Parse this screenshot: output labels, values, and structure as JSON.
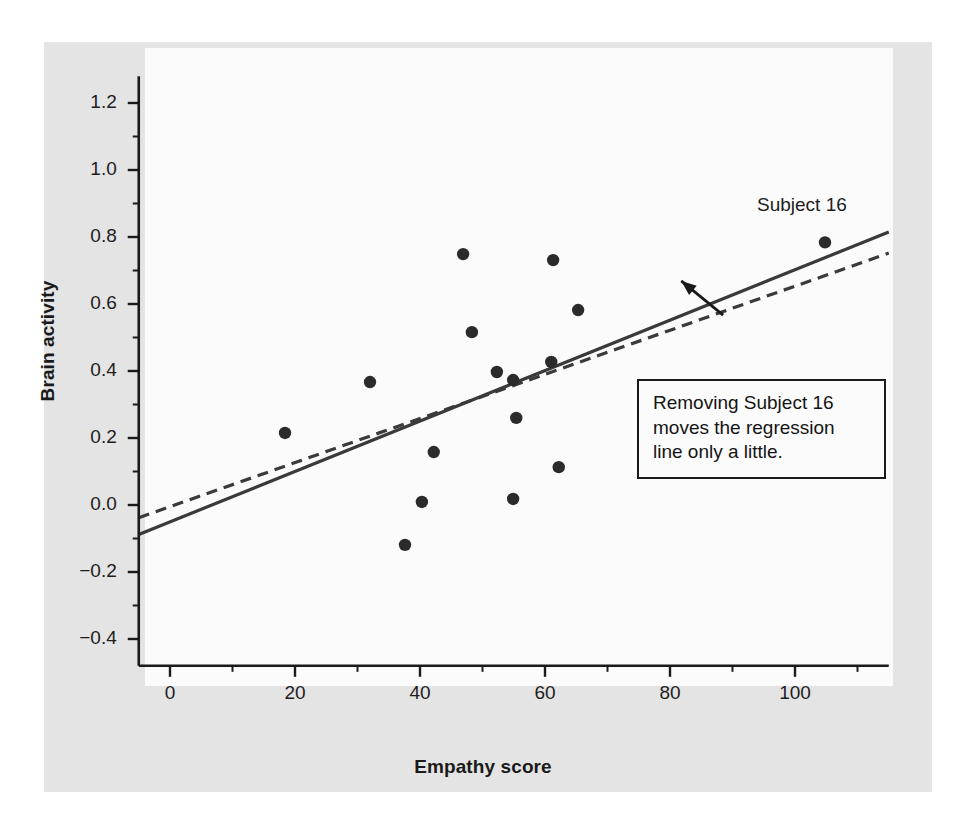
{
  "figure": {
    "background_color": "#e4e4e4",
    "plot_background_color": "#fbfbfb",
    "axis_color": "#1a1a1a",
    "point_color": "#2b2b2b"
  },
  "annotations": {
    "subject_label": "Subject 16",
    "callout_line_1": "Removing Subject 16",
    "callout_line_2": "moves the regression",
    "callout_line_3": "line only a little."
  },
  "chart_data": {
    "type": "scatter",
    "title": "",
    "xlabel": "Empathy score",
    "ylabel": "Brain activity",
    "xlim": [
      -5,
      115
    ],
    "ylim": [
      -0.48,
      1.28
    ],
    "xticks": [
      0,
      20,
      40,
      60,
      80,
      100
    ],
    "xtick_labels": [
      "0",
      "20",
      "40",
      "60",
      "80",
      "100"
    ],
    "yticks": [
      -0.4,
      -0.2,
      0.0,
      0.2,
      0.4,
      0.6,
      0.8,
      1.0,
      1.2
    ],
    "ytick_labels": [
      "-0.4",
      "-0.2",
      "0.0",
      "0.2",
      "0.4",
      "0.6",
      "0.8",
      "1.0",
      "1.2"
    ],
    "x_minor_ticks": [
      10,
      30,
      50,
      70,
      90,
      110
    ],
    "y_minor_ticks": [
      -0.3,
      -0.1,
      0.1,
      0.3,
      0.5,
      0.7,
      0.9,
      1.1
    ],
    "grid": false,
    "legend": false,
    "points": [
      {
        "x": 18.4,
        "y": 0.215
      },
      {
        "x": 32.0,
        "y": 0.367
      },
      {
        "x": 37.6,
        "y": -0.119
      },
      {
        "x": 40.3,
        "y": 0.009
      },
      {
        "x": 42.2,
        "y": 0.158
      },
      {
        "x": 46.9,
        "y": 0.749
      },
      {
        "x": 48.3,
        "y": 0.516
      },
      {
        "x": 52.3,
        "y": 0.397
      },
      {
        "x": 54.9,
        "y": 0.373
      },
      {
        "x": 54.9,
        "y": 0.018
      },
      {
        "x": 55.4,
        "y": 0.26
      },
      {
        "x": 61.0,
        "y": 0.427
      },
      {
        "x": 61.3,
        "y": 0.731
      },
      {
        "x": 62.2,
        "y": 0.113
      },
      {
        "x": 65.3,
        "y": 0.582
      },
      {
        "x": 104.8,
        "y": 0.784,
        "label": "Subject 16"
      }
    ],
    "series": [
      {
        "name": "Regression line (all subjects)",
        "style": "solid",
        "x": [
          -5,
          115
        ],
        "y": [
          -0.088,
          0.815
        ]
      },
      {
        "name": "Regression line (Subject 16 removed)",
        "style": "dashed",
        "x": [
          -5,
          115
        ],
        "y": [
          -0.038,
          0.752
        ]
      }
    ],
    "callout_arrow": {
      "from": [
        88.5,
        0.567
      ],
      "to": [
        81.8,
        0.669
      ]
    }
  }
}
